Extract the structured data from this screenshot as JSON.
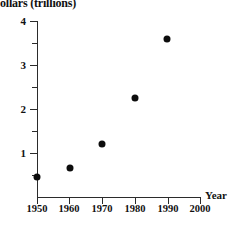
{
  "chart_data": {
    "type": "scatter",
    "title": "ollars (trillions)",
    "xlabel": "Year",
    "ylabel": "",
    "xlim": [
      1950,
      2000
    ],
    "ylim": [
      0,
      4
    ],
    "grid": false,
    "legend": "none",
    "x_ticks": [
      "1950",
      "1960",
      "1970",
      "1980",
      "1990",
      "2000"
    ],
    "y_ticks": [
      "1",
      "2",
      "3",
      "4"
    ],
    "y_minor_ticks": [
      0.5,
      1.5,
      2.5,
      3.5
    ],
    "x": [
      1950,
      1960,
      1970,
      1980,
      1990
    ],
    "values": [
      0.45,
      0.65,
      1.2,
      2.25,
      3.6
    ],
    "points": [
      {
        "x": 1950,
        "y": 0.45
      },
      {
        "x": 1960,
        "y": 0.65
      },
      {
        "x": 1970,
        "y": 1.2
      },
      {
        "x": 1980,
        "y": 2.25
      },
      {
        "x": 1990,
        "y": 3.6
      }
    ],
    "marker": "filled-circle",
    "marker_color": "#0d0d0d"
  },
  "axes": {
    "x_axis_name": "Year",
    "y_tick_1": "1",
    "y_tick_2": "2",
    "y_tick_3": "3",
    "y_tick_4": "4",
    "x_tick_1950": "1950",
    "x_tick_1960": "1960",
    "x_tick_1970": "1970",
    "x_tick_1980": "1980",
    "x_tick_1990": "1990",
    "x_tick_2000": "2000"
  }
}
